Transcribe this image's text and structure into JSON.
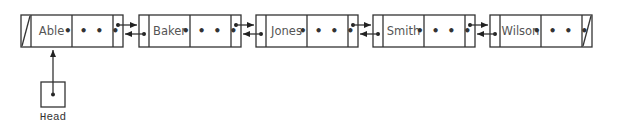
{
  "diagram": {
    "type": "doubly-linked-list",
    "nodes": [
      {
        "label": "Able",
        "data_placeholder": "• • • •",
        "prev": "null",
        "next": "Baker"
      },
      {
        "label": "Baker",
        "data_placeholder": "• • • •",
        "prev": "Able",
        "next": "Jones"
      },
      {
        "label": "Jones",
        "data_placeholder": "• • • •",
        "prev": "Baker",
        "next": "Smith"
      },
      {
        "label": "Smith",
        "data_placeholder": "• • • •",
        "prev": "Jones",
        "next": "Wilson"
      },
      {
        "label": "Wilson",
        "data_placeholder": "• • • •",
        "prev": "Smith",
        "next": "null"
      }
    ],
    "head": {
      "label": "Head",
      "points_to": "Able"
    },
    "colors": {
      "stroke": "#333333",
      "text": "#555555",
      "background": "#ffffff"
    }
  }
}
